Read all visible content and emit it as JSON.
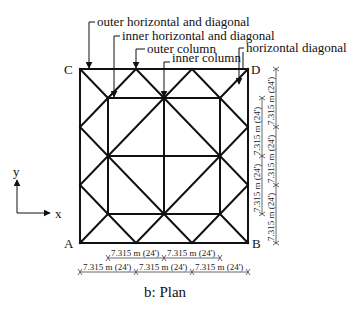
{
  "figure": {
    "caption": "b: Plan",
    "corners": {
      "A": "A",
      "B": "B",
      "C": "C",
      "D": "D"
    },
    "axes": {
      "x": "x",
      "y": "y"
    },
    "annotations": [
      "outer horizontal and diagonal",
      "inner horizontal and diagonal",
      "outer column",
      "inner column",
      "horizontal diagonal"
    ],
    "dimensions": {
      "bottom_row1": [
        "7.315 m (24')",
        "7.315 m (24')"
      ],
      "bottom_row2": [
        "7.315 m (24')",
        "7.315 m (24')",
        "7.315 m (24')"
      ],
      "right_col1": [
        "7.315 m (24')",
        "7.315 m (24')"
      ],
      "right_col2": [
        "7.315 m (24')",
        "7.315 m (24')",
        "7.315 m (24')"
      ]
    }
  }
}
